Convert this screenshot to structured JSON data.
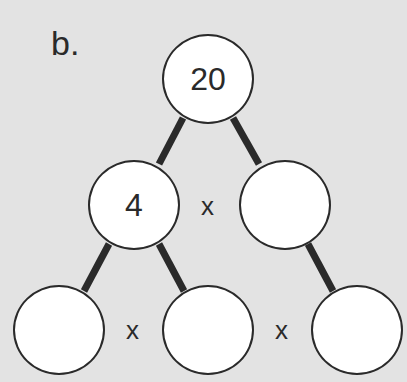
{
  "problem_label": "b.",
  "colors": {
    "background": "#e3e3e3",
    "stroke": "#2a2a2a",
    "node_fill": "#ffffff"
  },
  "tree": {
    "root": {
      "value": "20"
    },
    "level1": [
      {
        "value": "4"
      },
      {
        "value": ""
      }
    ],
    "level2": [
      {
        "value": ""
      },
      {
        "value": ""
      },
      {
        "value": ""
      }
    ]
  },
  "operators": {
    "level1": "x",
    "level2_left": "x",
    "level2_right": "x"
  }
}
